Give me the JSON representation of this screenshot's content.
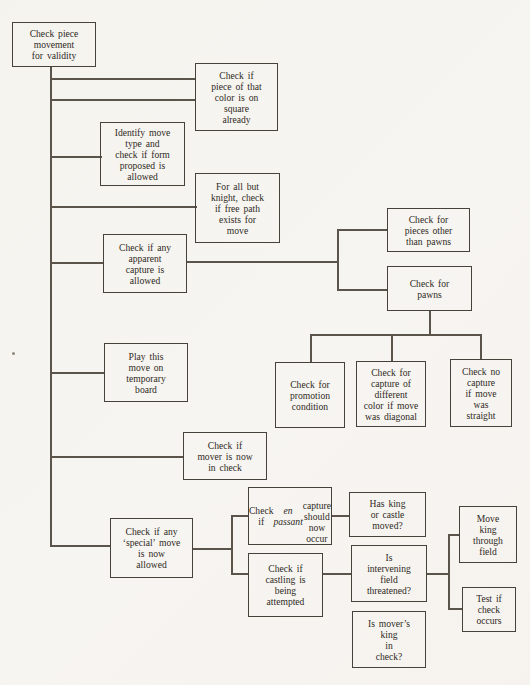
{
  "page": {
    "background": "#f6f4f0",
    "line_color": "#5a544b",
    "text_color": "#2e2a24"
  },
  "nodes": [
    {
      "id": "check-piece-movement",
      "label": "Check piece\nmovement\nfor validity"
    },
    {
      "id": "color-on-square",
      "label": "Check if\npiece of that\ncolor is on\nsquare\nalready"
    },
    {
      "id": "identify-move-type",
      "label": "Identify move\ntype and\ncheck if form\nproposed is\nallowed"
    },
    {
      "id": "free-path",
      "label": "For all but\nknight, check\nif free path\nexists for\nmove"
    },
    {
      "id": "apparent-capture",
      "label": "Check if any\napparent\ncapture is\nallowed"
    },
    {
      "id": "pieces-other-than-pawns",
      "label": "Check for\npieces other\nthan pawns"
    },
    {
      "id": "pawns",
      "label": "Check for\npawns"
    },
    {
      "id": "play-on-temporary-board",
      "label": "Play this\nmove on\ntemporary\nboard"
    },
    {
      "id": "promotion-condition",
      "label": "Check for\npromotion\ncondition"
    },
    {
      "id": "capture-different-color",
      "label": "Check for\ncapture of\ndifferent\ncolor if move\nwas diagonal"
    },
    {
      "id": "no-capture-straight",
      "label": "Check no\ncapture\nif move\nwas\nstraight"
    },
    {
      "id": "mover-in-check",
      "label": "Check if\nmover is now\nin check"
    },
    {
      "id": "special-move",
      "label": "Check if any\n‘special’ move\nis now\nallowed"
    },
    {
      "id": "en-passant",
      "pre": "Check if\n",
      "italic": "en passant",
      "post": "\ncapture should\nnow occur"
    },
    {
      "id": "castling",
      "label": "Check if\ncastling is\nbeing\nattempted"
    },
    {
      "id": "has-king-or-castle-moved",
      "label": "Has king\nor castle\nmoved?"
    },
    {
      "id": "intervening-field-threatened",
      "label": "Is\nintervening\nfield\nthreatened?"
    },
    {
      "id": "movers-king-in-check",
      "label": "Is mover’s\nking\nin\ncheck?"
    },
    {
      "id": "move-king-through-field",
      "label": "Move\nking\nthrough\nfield"
    },
    {
      "id": "test-if-check-occurs",
      "label": "Test if\ncheck\noccurs"
    }
  ],
  "edges": [
    {
      "from": "check-piece-movement",
      "to": "color-on-square"
    },
    {
      "from": "check-piece-movement",
      "to": "identify-move-type"
    },
    {
      "from": "check-piece-movement",
      "to": "free-path"
    },
    {
      "from": "check-piece-movement",
      "to": "apparent-capture"
    },
    {
      "from": "apparent-capture",
      "to": "pieces-other-than-pawns"
    },
    {
      "from": "apparent-capture",
      "to": "pawns"
    },
    {
      "from": "pawns",
      "to": "promotion-condition"
    },
    {
      "from": "pawns",
      "to": "capture-different-color"
    },
    {
      "from": "pawns",
      "to": "no-capture-straight"
    },
    {
      "from": "check-piece-movement",
      "to": "play-on-temporary-board"
    },
    {
      "from": "check-piece-movement",
      "to": "mover-in-check"
    },
    {
      "from": "check-piece-movement",
      "to": "special-move"
    },
    {
      "from": "special-move",
      "to": "en-passant"
    },
    {
      "from": "special-move",
      "to": "castling"
    },
    {
      "from": "en-passant",
      "to": "has-king-or-castle-moved"
    },
    {
      "from": "castling",
      "to": "intervening-field-threatened"
    },
    {
      "from": "intervening-field-threatened",
      "to": "move-king-through-field"
    },
    {
      "from": "intervening-field-threatened",
      "to": "test-if-check-occurs"
    }
  ]
}
